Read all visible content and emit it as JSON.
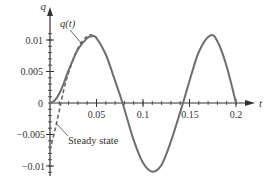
{
  "chart_data": {
    "type": "line",
    "title": "",
    "xlabel": "t",
    "ylabel": "q",
    "xlim": [
      0,
      0.2
    ],
    "ylim": [
      -0.011,
      0.012
    ],
    "x_ticks": [
      0.05,
      0.1,
      0.15,
      0.2
    ],
    "x_tick_labels": [
      "0.05",
      "0.1",
      "0.15",
      "0.2"
    ],
    "y_ticks": [
      0.01,
      0.005,
      0,
      -0.005,
      -0.01
    ],
    "y_tick_labels": [
      "0.01",
      "0.005",
      "0",
      "−0.005",
      "−0.01"
    ],
    "grid": false,
    "series": [
      {
        "name": "q(t)",
        "style": "solid",
        "color": "#6e6e6e",
        "x": [
          0,
          0.005,
          0.01,
          0.015,
          0.02,
          0.03,
          0.04,
          0.045,
          0.05,
          0.06,
          0.07,
          0.078,
          0.09,
          0.1,
          0.11,
          0.12,
          0.13,
          0.143,
          0.15,
          0.16,
          0.172,
          0.18,
          0.19,
          0.2
        ],
        "values": [
          0,
          0.0004,
          0.0015,
          0.0032,
          0.0052,
          0.0085,
          0.0103,
          0.0106,
          0.0103,
          0.0077,
          0.0035,
          0.0,
          -0.0059,
          -0.0095,
          -0.0109,
          -0.0098,
          -0.0061,
          0.0,
          0.0035,
          0.0081,
          0.0107,
          0.0098,
          0.0058,
          0.0
        ]
      },
      {
        "name": "Steady state",
        "style": "dashed",
        "color": "#6e6e6e",
        "x": [
          0.0,
          0.005,
          0.01,
          0.015,
          0.02,
          0.03,
          0.04,
          0.045,
          0.05
        ],
        "values": [
          -0.0075,
          -0.0045,
          -0.0012,
          0.0022,
          0.0048,
          0.0087,
          0.0106,
          0.0108,
          0.0104
        ]
      }
    ],
    "annotations": [
      {
        "text": "q(t)",
        "points_to": "solid curve near t=0.03"
      },
      {
        "text": "Steady state",
        "points_to": "dashed curve near t=0.004"
      }
    ]
  },
  "labels": {
    "x_axis": "t",
    "y_axis": "q",
    "qt_label": "q(t)",
    "steady_label": "Steady state",
    "x_ticks": [
      "0.05",
      "0.1",
      "0.15",
      "0.2"
    ],
    "y_ticks": [
      "0.01",
      "0.005",
      "0",
      "−0.005",
      "−0.01"
    ]
  }
}
